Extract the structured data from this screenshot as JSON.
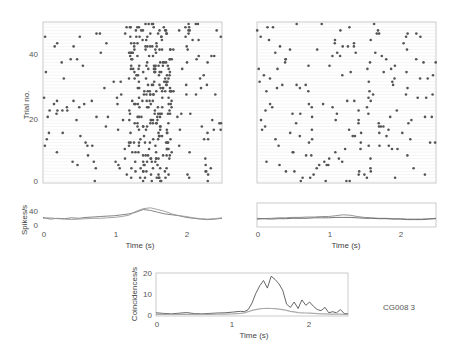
{
  "figure_label": "CG008 3",
  "chart_data": [
    {
      "id": "raster-left",
      "type": "scatter",
      "title": "",
      "xlabel": "",
      "ylabel": "Trial no.",
      "xlim": [
        0,
        2.5
      ],
      "ylim": [
        0,
        49
      ],
      "yticks": [
        0,
        20,
        40
      ],
      "ytick_labels": [
        "0",
        "20",
        "40"
      ],
      "grid": false,
      "description": "Spike raster, 49 trials; spikes concentrated between ~1.2 s and ~1.8 s",
      "spike_density": {
        "baseline_per_trial": 2,
        "burst_window_s": [
          1.2,
          1.8
        ],
        "burst_per_trial": 5
      }
    },
    {
      "id": "raster-right",
      "type": "scatter",
      "title": "",
      "xlabel": "",
      "ylabel": "",
      "xlim": [
        0,
        2.5
      ],
      "ylim": [
        0,
        49
      ],
      "grid": false,
      "description": "Spike raster, 49 trials; sparse spikes without strong time locking",
      "spike_density": {
        "baseline_per_trial": 2.5
      }
    },
    {
      "id": "rate-left",
      "type": "line",
      "xlabel": "Time (s)",
      "ylabel": "Spikes/s",
      "xlim": [
        0,
        2.5
      ],
      "ylim": [
        0,
        55
      ],
      "xticks": [
        0,
        1,
        2
      ],
      "xtick_labels": [
        "0",
        "1",
        "2"
      ],
      "yticks": [
        0,
        40
      ],
      "ytick_labels": [
        "0",
        "40"
      ],
      "x": [
        0,
        0.1,
        0.2,
        0.3,
        0.4,
        0.5,
        0.6,
        0.7,
        0.8,
        0.9,
        1.0,
        1.1,
        1.2,
        1.3,
        1.4,
        1.5,
        1.6,
        1.7,
        1.8,
        1.9,
        2.0,
        2.1,
        2.2,
        2.3,
        2.4,
        2.5
      ],
      "series": [
        {
          "name": "rate-a",
          "values": [
            22,
            18,
            20,
            19,
            21,
            20,
            22,
            23,
            24,
            25,
            26,
            28,
            30,
            34,
            40,
            38,
            34,
            30,
            28,
            26,
            22,
            20,
            18,
            17,
            18,
            20
          ]
        },
        {
          "name": "rate-b",
          "values": [
            20,
            21,
            19,
            18,
            17,
            18,
            19,
            20,
            20,
            21,
            22,
            24,
            27,
            36,
            42,
            44,
            40,
            36,
            30,
            26,
            24,
            21,
            19,
            18,
            19,
            21
          ]
        }
      ]
    },
    {
      "id": "rate-right",
      "type": "line",
      "xlabel": "Time (s)",
      "ylabel": "",
      "xlim": [
        0,
        2.5
      ],
      "ylim": [
        0,
        55
      ],
      "xticks": [
        0,
        1,
        2
      ],
      "xtick_labels": [
        "0",
        "1",
        "2"
      ],
      "x": [
        0,
        0.1,
        0.2,
        0.3,
        0.4,
        0.5,
        0.6,
        0.7,
        0.8,
        0.9,
        1.0,
        1.1,
        1.2,
        1.3,
        1.4,
        1.5,
        1.6,
        1.7,
        1.8,
        1.9,
        2.0,
        2.1,
        2.2,
        2.3,
        2.4,
        2.5
      ],
      "series": [
        {
          "name": "rate-a",
          "values": [
            20,
            19,
            20,
            21,
            21,
            22,
            22,
            23,
            23,
            24,
            24,
            26,
            28,
            27,
            24,
            22,
            21,
            20,
            20,
            19,
            19,
            18,
            18,
            18,
            19,
            20
          ]
        },
        {
          "name": "rate-b",
          "values": [
            18,
            19,
            18,
            19,
            19,
            20,
            20,
            20,
            21,
            21,
            21,
            22,
            22,
            22,
            21,
            20,
            20,
            19,
            19,
            18,
            18,
            17,
            17,
            17,
            18,
            19
          ]
        }
      ]
    },
    {
      "id": "coincidences",
      "type": "line",
      "xlabel": "Time (s)",
      "ylabel": "Coincidences/s",
      "xlim": [
        0,
        2.5
      ],
      "ylim": [
        0,
        20
      ],
      "xticks": [
        0,
        1,
        2
      ],
      "xtick_labels": [
        "0",
        "1",
        "2"
      ],
      "yticks": [
        0,
        10,
        20
      ],
      "ytick_labels": [
        "0",
        "10",
        "20"
      ],
      "x": [
        0,
        0.1,
        0.2,
        0.3,
        0.4,
        0.5,
        0.6,
        0.7,
        0.8,
        0.9,
        1.0,
        1.1,
        1.15,
        1.2,
        1.25,
        1.3,
        1.35,
        1.4,
        1.45,
        1.5,
        1.55,
        1.6,
        1.65,
        1.7,
        1.75,
        1.8,
        1.85,
        1.9,
        1.95,
        2.0,
        2.05,
        2.1,
        2.15,
        2.2,
        2.25,
        2.3,
        2.35,
        2.4,
        2.45,
        2.5
      ],
      "series": [
        {
          "name": "observed",
          "values": [
            1.5,
            1.2,
            1.0,
            1.3,
            1.6,
            1.1,
            1.0,
            1.2,
            1.4,
            1.5,
            1.8,
            2.2,
            2.0,
            3.0,
            6.0,
            10.5,
            14.0,
            16.5,
            13.0,
            18.5,
            17.0,
            15.0,
            12.0,
            5.5,
            4.0,
            6.5,
            3.5,
            7.5,
            5.0,
            6.5,
            4.5,
            3.0,
            2.5,
            4.0,
            1.5,
            2.0,
            1.5,
            3.0,
            1.2,
            1.0
          ]
        },
        {
          "name": "expected",
          "values": [
            0.8,
            0.8,
            0.7,
            0.8,
            0.8,
            0.8,
            0.7,
            0.8,
            0.9,
            0.9,
            1.0,
            1.2,
            1.5,
            2.0,
            2.6,
            3.0,
            3.3,
            3.5,
            3.6,
            3.5,
            3.4,
            3.2,
            3.0,
            2.6,
            2.2,
            1.9,
            1.6,
            1.5,
            1.4,
            1.3,
            1.2,
            1.1,
            1.0,
            1.0,
            0.9,
            0.9,
            0.9,
            0.9,
            0.8,
            0.8
          ]
        }
      ]
    }
  ]
}
